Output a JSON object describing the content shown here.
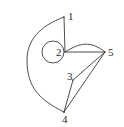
{
  "diagram": {
    "type": "graph",
    "nodes": [
      {
        "id": "1",
        "label": "1",
        "x": 64,
        "y": 17,
        "lx": 68,
        "ly": 20
      },
      {
        "id": "2",
        "label": "2",
        "x": 65,
        "y": 52,
        "lx": 56,
        "ly": 56
      },
      {
        "id": "3",
        "label": "3",
        "x": 73,
        "y": 80,
        "lx": 67,
        "ly": 80
      },
      {
        "id": "4",
        "label": "4",
        "x": 64,
        "y": 112,
        "lx": 62,
        "ly": 123
      },
      {
        "id": "5",
        "label": "5",
        "x": 105,
        "y": 52,
        "lx": 108,
        "ly": 56
      }
    ],
    "edges": [
      {
        "from": "1",
        "to": "2",
        "kind": "straight"
      },
      {
        "from": "1",
        "to": "4",
        "kind": "curve"
      },
      {
        "from": "2",
        "to": "2",
        "kind": "loop"
      },
      {
        "from": "2",
        "to": "5",
        "kind": "straight"
      },
      {
        "from": "2",
        "to": "5",
        "kind": "curve"
      },
      {
        "from": "3",
        "to": "5",
        "kind": "straight"
      },
      {
        "from": "4",
        "to": "5",
        "kind": "straight"
      },
      {
        "from": "3",
        "to": "4",
        "kind": "straight"
      }
    ],
    "colors": {
      "stroke": "#3a3a3a",
      "label": "#2a2a2a",
      "background": "#ffffff"
    }
  }
}
